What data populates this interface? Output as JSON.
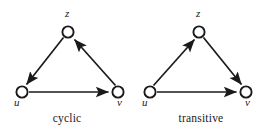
{
  "figure": {
    "width": 268,
    "height": 135,
    "background": "#ffffff",
    "ink_color": "#1a1a1a"
  },
  "panels": [
    {
      "id": "cyclic",
      "caption": "cyclic",
      "nodes": [
        {
          "id": "u",
          "label": "u",
          "cx": 22,
          "cy": 92,
          "r": 6,
          "label_x": 14,
          "label_y": 101
        },
        {
          "id": "z",
          "label": "z",
          "cx": 68,
          "cy": 32,
          "r": 6,
          "label_x": 65,
          "label_y": 12
        },
        {
          "id": "v",
          "label": "v",
          "cx": 118,
          "cy": 92,
          "r": 6,
          "label_x": 117,
          "label_y": 101
        }
      ],
      "edges": [
        {
          "from": "u",
          "to": "v",
          "arrow": "at-end"
        },
        {
          "from": "v",
          "to": "z",
          "arrow": "at-end"
        },
        {
          "from": "z",
          "to": "u",
          "arrow": "at-end"
        }
      ]
    },
    {
      "id": "transitive",
      "caption": "transitive",
      "nodes": [
        {
          "id": "u",
          "label": "u",
          "cx": 16,
          "cy": 92,
          "r": 6,
          "label_x": 8,
          "label_y": 101
        },
        {
          "id": "z",
          "label": "z",
          "cx": 65,
          "cy": 32,
          "r": 6,
          "label_x": 62,
          "label_y": 12
        },
        {
          "id": "v",
          "label": "v",
          "cx": 112,
          "cy": 92,
          "r": 6,
          "label_x": 111,
          "label_y": 101
        }
      ],
      "edges": [
        {
          "from": "u",
          "to": "v",
          "arrow": "at-end"
        },
        {
          "from": "u",
          "to": "z",
          "arrow": "at-end"
        },
        {
          "from": "z",
          "to": "v",
          "arrow": "at-end"
        }
      ]
    }
  ]
}
